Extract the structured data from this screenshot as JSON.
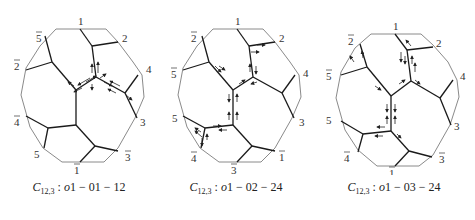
{
  "figure": {
    "panels": [
      {
        "caption": {
          "symbol": "C",
          "subscript": "12,3",
          "sep": " : ",
          "prefix": "o",
          "text": "1 − 01 − 12"
        },
        "labels": [
          "1",
          "2",
          "4",
          "3",
          "3̄",
          "1̄",
          "5",
          "4̄",
          "2̄",
          "5̄"
        ]
      },
      {
        "caption": {
          "symbol": "C",
          "subscript": "12,3",
          "sep": " : ",
          "prefix": "o",
          "text": "1 − 02 − 24"
        },
        "labels": [
          "1",
          "2",
          "4",
          "3",
          "1̄",
          "3̄",
          "4̄",
          "5",
          "5̄",
          "2̄"
        ]
      },
      {
        "caption": {
          "symbol": "C",
          "subscript": "12,3",
          "sep": " : ",
          "prefix": "o",
          "text": "1 − 03 − 24"
        },
        "labels": [
          "1",
          "2",
          "4",
          "3",
          "3̄",
          "1̄",
          "4̄",
          "5",
          "5̄",
          "2̄"
        ]
      }
    ],
    "colors": {
      "outer": "#8a8a8a",
      "inner": "#1a1a1a",
      "arrow": "#222222"
    }
  }
}
